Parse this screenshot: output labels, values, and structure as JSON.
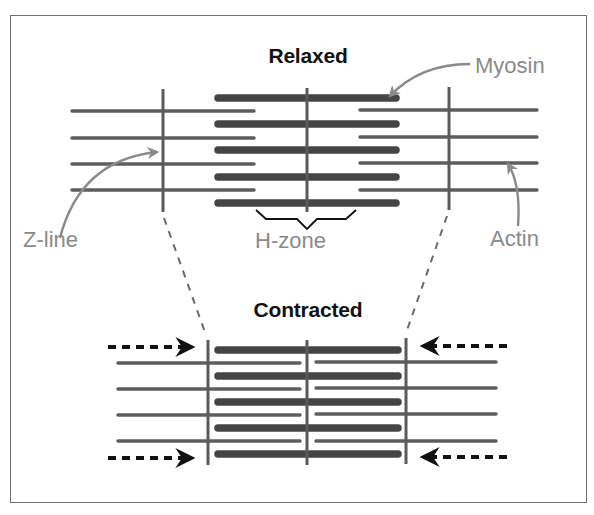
{
  "figure": {
    "width": 594,
    "height": 515,
    "frame": {
      "x": 10,
      "y": 15,
      "w": 577,
      "h": 488
    },
    "colors": {
      "background": "#ffffff",
      "frame": "#6f6f6f",
      "filament": "#5d5d5d",
      "myosin": "#454545",
      "zline": "#5a5a5a",
      "label": "#8a8a8a",
      "title": "#111111",
      "bracket": "#111111",
      "arrow": "#111111",
      "dashed_connector": "#6a6a6a",
      "pointer": "#8a8a8a"
    }
  },
  "relaxed": {
    "title": "Relaxed",
    "title_pos": {
      "x": 308,
      "y": 44
    },
    "z_lines": [
      {
        "x": 163,
        "y1": 89,
        "y2": 212
      },
      {
        "x": 449,
        "y1": 87,
        "y2": 210
      }
    ],
    "m_line": {
      "x": 307,
      "y1": 88,
      "y2": 212
    },
    "myosin": {
      "x1": 218,
      "x2": 396,
      "rows": [
        98,
        124,
        150,
        177,
        203
      ]
    },
    "actin_left": {
      "x1": 72,
      "x2": 254,
      "rows": [
        111,
        138,
        164,
        190
      ]
    },
    "actin_right": {
      "x1": 360,
      "x2": 537,
      "rows": [
        110,
        137,
        163,
        190
      ]
    },
    "h_zone": {
      "label": "H-zone",
      "label_pos": {
        "x": 255,
        "y": 228
      },
      "bracket": {
        "x1": 256,
        "x2": 356,
        "y_top": 210,
        "y_flat": 219,
        "y_tip": 229,
        "mid_x": 307
      }
    }
  },
  "contracted": {
    "title": "Contracted",
    "title_pos": {
      "x": 308,
      "y": 298
    },
    "z_lines": [
      {
        "x": 208,
        "y1": 340,
        "y2": 465
      },
      {
        "x": 406,
        "y1": 338,
        "y2": 464
      }
    ],
    "m_line": {
      "x": 307,
      "y1": 340,
      "y2": 465
    },
    "myosin": {
      "x1": 218,
      "x2": 398,
      "rows": [
        350,
        376,
        402,
        428,
        454
      ]
    },
    "actin_left": {
      "x1": 118,
      "x2": 300,
      "rows": [
        363,
        389,
        415,
        441
      ]
    },
    "actin_right": {
      "x1": 316,
      "x2": 496,
      "rows": [
        362,
        388,
        414,
        441
      ]
    },
    "arrows": [
      {
        "side": "left",
        "x1": 108,
        "x2": 192,
        "y": 347,
        "direction": "right"
      },
      {
        "side": "left",
        "x1": 108,
        "x2": 192,
        "y": 458,
        "direction": "right"
      },
      {
        "side": "right",
        "x1": 507,
        "x2": 423,
        "y": 346,
        "direction": "left"
      },
      {
        "side": "right",
        "x1": 507,
        "x2": 423,
        "y": 457,
        "direction": "left"
      }
    ]
  },
  "connectors": [
    {
      "x1": 164,
      "y1": 218,
      "x2": 206,
      "y2": 335
    },
    {
      "x1": 447,
      "y1": 216,
      "x2": 406,
      "y2": 333
    }
  ],
  "labels": {
    "myosin": {
      "text": "Myosin",
      "x": 475,
      "y": 53,
      "pointer": {
        "from": [
          470,
          64
        ],
        "ctrl": [
          420,
          64
        ],
        "to": [
          390,
          96
        ]
      }
    },
    "z_line": {
      "text": "Z-line",
      "x": 23,
      "y": 227,
      "pointer": {
        "from": [
          60,
          238
        ],
        "ctrl": [
          80,
          160
        ],
        "to": [
          157,
          152
        ]
      }
    },
    "actin": {
      "text": "Actin",
      "x": 490,
      "y": 226,
      "pointer": {
        "from": [
          518,
          226
        ],
        "ctrl": [
          521,
          185
        ],
        "to": [
          508,
          164
        ]
      }
    }
  }
}
